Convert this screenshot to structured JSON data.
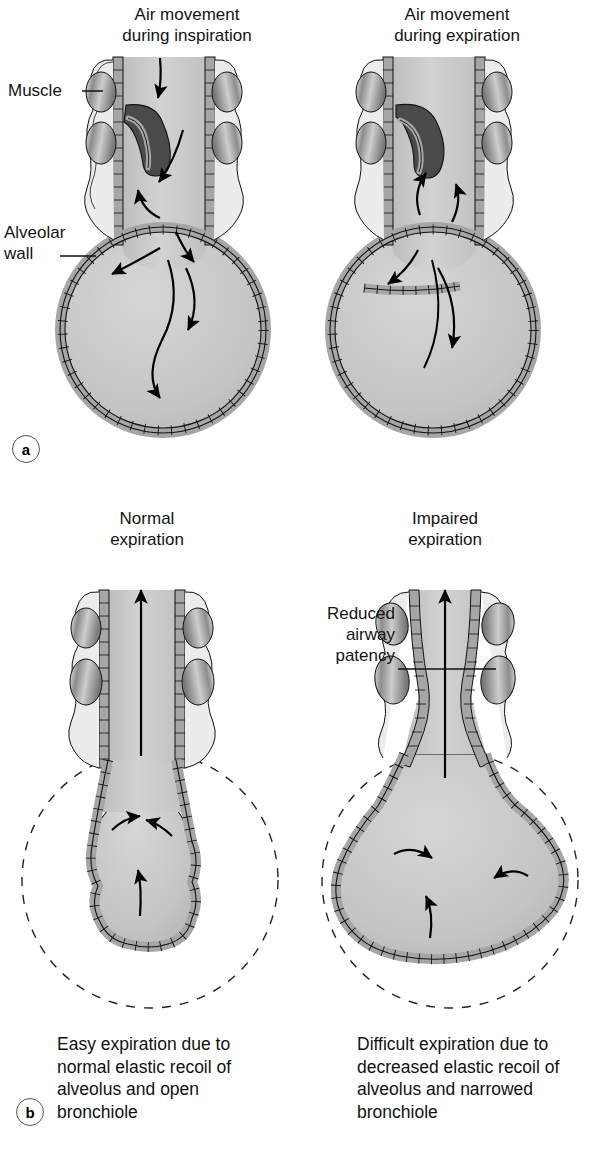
{
  "figure": {
    "type": "anatomical-diagram",
    "background_color": "#ffffff"
  },
  "colors": {
    "lumen_fill": "#c9c9c9",
    "alveolus_fill": "#c4c4c4",
    "epithelium_fill": "#a6a6a6",
    "muscle_fill": "#b5b5b5",
    "mucus_fill": "#4a4a4a",
    "outline": "#111111",
    "dashed_outline": "#222222",
    "text": "#141414"
  },
  "panels": [
    {
      "id": "a",
      "marker": "a",
      "sub_panels": [
        {
          "id": "a-left",
          "title": "Air movement\nduring inspiration",
          "annotations": [
            {
              "label": "Muscle",
              "name": "muscle"
            },
            {
              "label": "Alveolar\nwall",
              "name": "alveolar-wall"
            }
          ],
          "airflow_direction": "inward",
          "arrow_count": 6
        },
        {
          "id": "a-right",
          "title": "Air movement\nduring expiration",
          "annotations": [],
          "airflow_direction": "outward",
          "arrow_count": 5
        }
      ]
    },
    {
      "id": "b",
      "marker": "b",
      "sub_panels": [
        {
          "id": "b-left",
          "title": "Normal\nexpiration",
          "annotations": [],
          "caption": "Easy expiration due to\nnormal elastic recoil of\nalveolus and open\nbronchiole",
          "alveolus_state": "recoiled",
          "bronchiole_state": "open",
          "arrow_count": 4
        },
        {
          "id": "b-right",
          "title": "Impaired\nexpiration",
          "annotations": [
            {
              "label": "Reduced\nairway\npatency",
              "name": "reduced-airway-patency"
            }
          ],
          "caption": "Difficult expiration due to\ndecreased elastic recoil of\nalveolus and narrowed\nbronchiole",
          "alveolus_state": "hyperinflated",
          "bronchiole_state": "narrowed",
          "arrow_count": 4
        }
      ]
    }
  ]
}
